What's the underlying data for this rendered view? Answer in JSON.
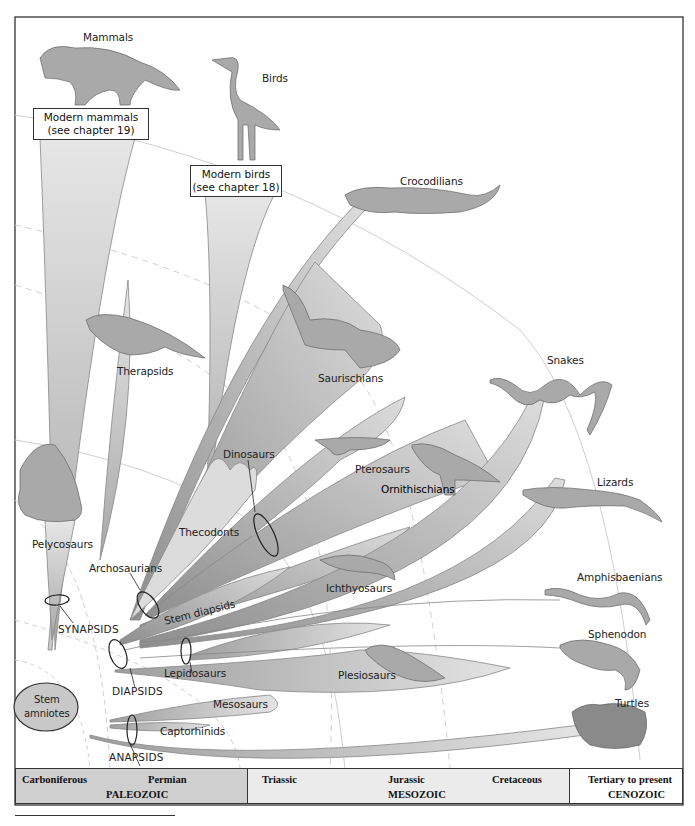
{
  "diagram": {
    "type": "phylogenetic-tree",
    "frame_color": "#333333",
    "branch_fill": "#d0d0d0",
    "branch_dark": "#9a9a9a",
    "root": {
      "label_line1": "Stem",
      "label_line2": "amniotes",
      "fill": "#c8c8c8"
    },
    "callout_boxes": [
      {
        "line1": "Modern mammals",
        "line2": "(see chapter 19)"
      },
      {
        "line1": "Modern birds",
        "line2": "(see chapter 18)"
      }
    ],
    "taxa": {
      "mammals": "Mammals",
      "birds": "Birds",
      "crocodilians": "Crocodilians",
      "therapsids": "Therapsids",
      "saurischians": "Saurischians",
      "snakes": "Snakes",
      "pterosaurs": "Pterosaurs",
      "ornithischians": "Ornithischians",
      "dinosaurs": "Dinosaurs",
      "pelycosaurs": "Pelycosaurs",
      "thecodonts": "Thecodonts",
      "lizards": "Lizards",
      "archosaurians": "Archosaurians",
      "ichthyosaurs": "Ichthyosaurs",
      "stem_diapsids": "Stem diapsids",
      "amphisbaenians": "Amphisbaenians",
      "synapsids": "SYNAPSIDS",
      "sphenodon": "Sphenodon",
      "lepidosaurs": "Lepidosaurs",
      "plesiosaurs": "Plesiosaurs",
      "diapsids": "DIAPSIDS",
      "mesosaurs": "Mesosaurs",
      "turtles": "Turtles",
      "captorhinids": "Captorhinids",
      "anapsids": "ANAPSIDS"
    },
    "timeline": {
      "paleozoic": {
        "name": "PALEOZOIC",
        "periods": [
          "Carboniferous",
          "Permian"
        ],
        "fill": "#cfcfcf"
      },
      "mesozoic": {
        "name": "MESOZOIC",
        "periods": [
          "Triassic",
          "Jurassic",
          "Cretaceous"
        ],
        "fill": "#ebebeb"
      },
      "cenozoic": {
        "name": "CENOZOIC",
        "periods": [
          "Tertiary to present"
        ],
        "fill": "#ffffff"
      }
    }
  }
}
